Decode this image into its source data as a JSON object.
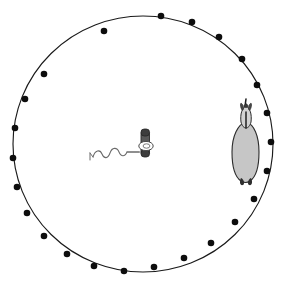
{
  "figure": {
    "title": "Circular open-field arena with perimeter markers",
    "caption": "",
    "width": 284,
    "height": 288,
    "background_color": "#ffffff"
  },
  "arena": {
    "name": "circular-arena",
    "shape": "circle",
    "center_x": 143,
    "center_y": 144,
    "radius_x": 130,
    "radius_y": 128,
    "outline_color": "#1a1a1a",
    "outline_width": 1.15,
    "fill_color": "#ffffff",
    "label": "Circular arena"
  },
  "perimeter_markers": {
    "name": "perimeter-markers",
    "count": 24,
    "color": "#0d0d0d",
    "shape": "circle",
    "radius": 3.3,
    "label": "Perimeter cue markers",
    "angles_deg": [
      82,
      68,
      54,
      40,
      27,
      14,
      1,
      -12,
      -26,
      -40,
      -53,
      -66,
      -80,
      -94,
      -108,
      -122,
      -135,
      -148,
      -161,
      -175,
      170,
      156,
      140,
      110
    ],
    "positions": [
      {
        "x": 161,
        "y": 16
      },
      {
        "x": 192,
        "y": 22
      },
      {
        "x": 219,
        "y": 37
      },
      {
        "x": 242,
        "y": 59
      },
      {
        "x": 257,
        "y": 85
      },
      {
        "x": 267,
        "y": 113
      },
      {
        "x": 271,
        "y": 142
      },
      {
        "x": 267,
        "y": 171
      },
      {
        "x": 254,
        "y": 199
      },
      {
        "x": 235,
        "y": 222
      },
      {
        "x": 211,
        "y": 243
      },
      {
        "x": 184,
        "y": 258
      },
      {
        "x": 154,
        "y": 267
      },
      {
        "x": 124,
        "y": 271
      },
      {
        "x": 94,
        "y": 266
      },
      {
        "x": 67,
        "y": 254
      },
      {
        "x": 44,
        "y": 236
      },
      {
        "x": 27,
        "y": 213
      },
      {
        "x": 17,
        "y": 187
      },
      {
        "x": 13,
        "y": 158
      },
      {
        "x": 15,
        "y": 128
      },
      {
        "x": 25,
        "y": 99
      },
      {
        "x": 44,
        "y": 74
      },
      {
        "x": 104,
        "y": 31
      }
    ]
  },
  "mouse": {
    "name": "mouse-figure",
    "label": "Mouse",
    "body_color": "#c6c6c6",
    "outline_color": "#2b2b2b",
    "tail_color": "#1f1f1f",
    "center_x": 246,
    "center_y": 145,
    "orientation": "head-up",
    "parts": [
      "tail",
      "body",
      "head",
      "ears",
      "snout",
      "feet"
    ]
  },
  "center_device": {
    "name": "center-device",
    "label": "Tethered stimulus device",
    "barrel_color": "#595959",
    "cap_color": "#3d3d3d",
    "ring_color": "#ffffff",
    "wire_color": "#6a6a6a",
    "center_x": 146,
    "center_y": 143,
    "wire_start_x": 92,
    "wire_start_y": 155,
    "wire_end_x": 139,
    "wire_end_y": 152,
    "has_coiled_wire": true
  },
  "legend": {
    "items": []
  }
}
